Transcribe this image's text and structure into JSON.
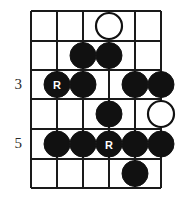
{
  "diagram": {
    "type": "guitar-fretboard-scale-diagram",
    "title": "",
    "geometry": {
      "string_x": [
        31,
        57,
        83,
        109,
        135,
        161
      ],
      "fret_y": [
        11,
        41,
        70,
        99,
        129,
        159,
        188
      ],
      "string_count": 6,
      "fret_row_count": 6,
      "dot_radius": 13,
      "open_dot_radius": 13
    },
    "fret_labels": [
      {
        "text": "3",
        "row": 3,
        "x": 10,
        "y": 77
      },
      {
        "text": "5",
        "row": 5,
        "x": 10,
        "y": 136
      }
    ],
    "notes": [
      {
        "row": 1,
        "string": 4,
        "style": "open",
        "label": ""
      },
      {
        "row": 2,
        "string": 3,
        "style": "filled",
        "label": ""
      },
      {
        "row": 2,
        "string": 4,
        "style": "filled",
        "label": ""
      },
      {
        "row": 3,
        "string": 2,
        "style": "filled",
        "label": "R"
      },
      {
        "row": 3,
        "string": 3,
        "style": "filled",
        "label": ""
      },
      {
        "row": 3,
        "string": 5,
        "style": "filled",
        "label": ""
      },
      {
        "row": 3,
        "string": 6,
        "style": "filled",
        "label": ""
      },
      {
        "row": 4,
        "string": 4,
        "style": "filled",
        "label": ""
      },
      {
        "row": 4,
        "string": 6,
        "style": "open",
        "label": ""
      },
      {
        "row": 5,
        "string": 2,
        "style": "filled",
        "label": ""
      },
      {
        "row": 5,
        "string": 3,
        "style": "filled",
        "label": ""
      },
      {
        "row": 5,
        "string": 4,
        "style": "filled",
        "label": "R"
      },
      {
        "row": 5,
        "string": 5,
        "style": "filled",
        "label": ""
      },
      {
        "row": 5,
        "string": 6,
        "style": "filled",
        "label": ""
      },
      {
        "row": 6,
        "string": 5,
        "style": "filled",
        "label": ""
      }
    ],
    "colors": {
      "line": "#1a1a1a",
      "note_fill": "#111111",
      "note_open_fill": "#ffffff",
      "note_label": "#ffffff",
      "fret_label": "#2b2b2b",
      "background": "#ffffff"
    }
  }
}
